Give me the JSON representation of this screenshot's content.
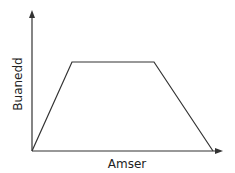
{
  "chart_data": {
    "type": "line",
    "title": "",
    "xlabel": "Amser",
    "ylabel": "Buanedd",
    "x": [
      0,
      1,
      3,
      4
    ],
    "values": [
      0,
      1,
      1,
      0
    ],
    "shape": "trapezoid",
    "grid": false,
    "legend": null,
    "ticks": "none",
    "axis_arrows": true,
    "color": "#333333"
  }
}
